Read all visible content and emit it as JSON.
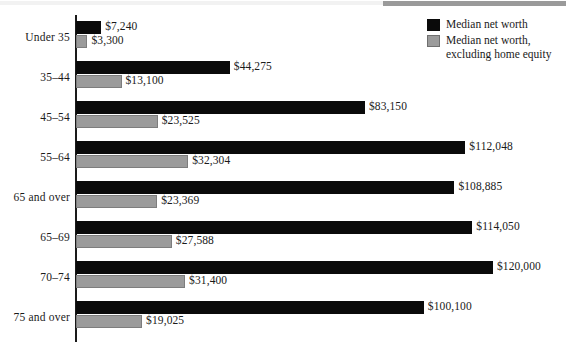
{
  "legend": {
    "series": [
      {
        "label": "Median net worth",
        "label_line2": "",
        "color": "#0a0a0a",
        "swatch_name": "legend-swatch-dark"
      },
      {
        "label": "Median net worth,",
        "label_line2": "excluding home equity",
        "color": "#9b9b9b",
        "swatch_name": "legend-swatch-light"
      }
    ]
  },
  "chart_data": {
    "type": "bar",
    "orientation": "horizontal",
    "title": "",
    "subtitle": "",
    "xlabel": "",
    "ylabel": "",
    "grid": false,
    "legend_position": "top-right",
    "xlim": [
      0,
      120000
    ],
    "categories": [
      "Under 35",
      "35–44",
      "45–54",
      "55–64",
      "65 and over",
      "65–69",
      "70–74",
      "75 and over"
    ],
    "series": [
      {
        "name": "Median net worth",
        "color": "#0a0a0a",
        "values": [
          7240,
          44275,
          83150,
          112048,
          108885,
          114050,
          120000,
          100100
        ],
        "labels": [
          "$7,240",
          "$44,275",
          "$83,150",
          "$112,048",
          "$108,885",
          "$114,050",
          "$120,000",
          "$100,100"
        ]
      },
      {
        "name": "Median net worth, excluding home equity",
        "color": "#9b9b9b",
        "values": [
          3300,
          13100,
          23525,
          32304,
          23369,
          27588,
          31400,
          19025
        ],
        "labels": [
          "$3,300",
          "$13,100",
          "$23,525",
          "$32,304",
          "$23,369",
          "$27,588",
          "$31,400",
          "$19,025"
        ]
      }
    ]
  },
  "axis": {
    "origin_x": 76,
    "px_per_unit": 0.003475
  }
}
